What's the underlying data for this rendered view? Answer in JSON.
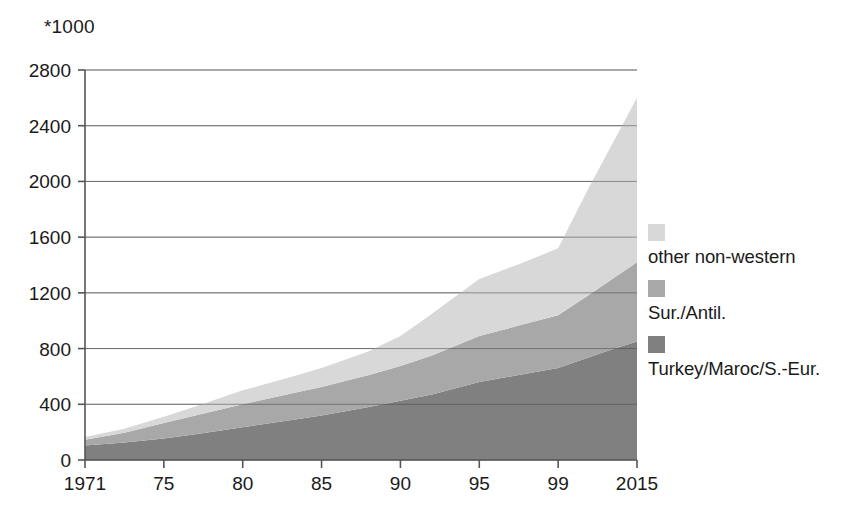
{
  "chart_data": {
    "type": "area",
    "title": "",
    "subtitle": "",
    "unit_label": "*1000",
    "xlabel": "",
    "ylabel": "",
    "stacked": true,
    "grid": true,
    "legend_position": "right",
    "ylim": [
      0,
      2800
    ],
    "ytick_values": [
      0,
      400,
      800,
      1200,
      1600,
      2000,
      2400,
      2800
    ],
    "ytick_labels": [
      "0",
      "400",
      "800",
      "1200",
      "1600",
      "2000",
      "2400",
      "2800"
    ],
    "x": [
      1971,
      1975,
      1980,
      1985,
      1990,
      1995,
      1999,
      2015
    ],
    "xtick_labels": [
      "1971",
      "75",
      "80",
      "85",
      "90",
      "95",
      "99",
      "2015"
    ],
    "series": [
      {
        "name": "Turkey/Maroc/S.-Eur.",
        "color": "#808080",
        "values": [
          105,
          155,
          235,
          320,
          425,
          560,
          660,
          850
        ],
        "points": [
          {
            "x": 1971,
            "y": 105
          },
          {
            "x": 1973,
            "y": 125
          },
          {
            "x": 1975,
            "y": 155
          },
          {
            "x": 1977,
            "y": 185
          },
          {
            "x": 1980,
            "y": 235
          },
          {
            "x": 1983,
            "y": 285
          },
          {
            "x": 1985,
            "y": 320
          },
          {
            "x": 1988,
            "y": 380
          },
          {
            "x": 1990,
            "y": 425
          },
          {
            "x": 1992,
            "y": 470
          },
          {
            "x": 1995,
            "y": 560
          },
          {
            "x": 1997,
            "y": 610
          },
          {
            "x": 1999,
            "y": 660
          },
          {
            "x": 2005,
            "y": 735
          },
          {
            "x": 2010,
            "y": 795
          },
          {
            "x": 2015,
            "y": 850
          }
        ]
      },
      {
        "name": "Sur./Antil.",
        "color": "#a8a8a8",
        "values": [
          40,
          110,
          165,
          205,
          250,
          330,
          380,
          570
        ],
        "points": [
          {
            "x": 1971,
            "y": 40
          },
          {
            "x": 1973,
            "y": 70
          },
          {
            "x": 1975,
            "y": 110
          },
          {
            "x": 1977,
            "y": 135
          },
          {
            "x": 1980,
            "y": 165
          },
          {
            "x": 1983,
            "y": 190
          },
          {
            "x": 1985,
            "y": 205
          },
          {
            "x": 1988,
            "y": 230
          },
          {
            "x": 1990,
            "y": 250
          },
          {
            "x": 1992,
            "y": 280
          },
          {
            "x": 1995,
            "y": 330
          },
          {
            "x": 1997,
            "y": 355
          },
          {
            "x": 1999,
            "y": 380
          },
          {
            "x": 2005,
            "y": 445
          },
          {
            "x": 2010,
            "y": 505
          },
          {
            "x": 2015,
            "y": 570
          }
        ]
      },
      {
        "name": "other non-western",
        "color": "#d8d8d8",
        "values": [
          20,
          45,
          100,
          135,
          215,
          410,
          480,
          1180
        ],
        "points": [
          {
            "x": 1971,
            "y": 20
          },
          {
            "x": 1973,
            "y": 30
          },
          {
            "x": 1975,
            "y": 45
          },
          {
            "x": 1977,
            "y": 65
          },
          {
            "x": 1980,
            "y": 100
          },
          {
            "x": 1983,
            "y": 120
          },
          {
            "x": 1985,
            "y": 135
          },
          {
            "x": 1988,
            "y": 170
          },
          {
            "x": 1990,
            "y": 215
          },
          {
            "x": 1992,
            "y": 300
          },
          {
            "x": 1995,
            "y": 410
          },
          {
            "x": 1997,
            "y": 440
          },
          {
            "x": 1999,
            "y": 480
          },
          {
            "x": 2005,
            "y": 760
          },
          {
            "x": 2010,
            "y": 970
          },
          {
            "x": 2015,
            "y": 1180
          }
        ]
      }
    ],
    "totals": [
      165,
      310,
      500,
      660,
      890,
      1300,
      1520,
      2600
    ]
  },
  "legend": {
    "items": [
      {
        "label": "other non-western",
        "color": "#d8d8d8"
      },
      {
        "label": "Sur./Antil.",
        "color": "#a8a8a8"
      },
      {
        "label": "Turkey/Maroc/S.-Eur.",
        "color": "#808080"
      }
    ]
  },
  "axis": {
    "unit_label": "*1000",
    "axis_color": "#555555",
    "grid_color": "#999999"
  }
}
